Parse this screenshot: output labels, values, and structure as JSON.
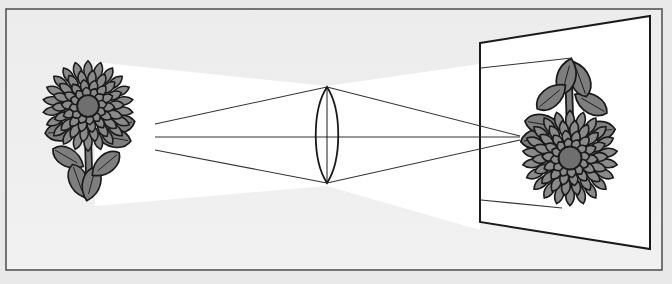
{
  "diagram": {
    "title": "",
    "colors": {
      "background": "#e9e9e9",
      "panel": "#efefef",
      "frame": "#555555",
      "light_cone": "#ffffff",
      "ink": "#1a1a1a",
      "petal": "#8a8a8a",
      "leaf": "#7e7e7e",
      "flower_center": "#6f6f6f",
      "screen": "#ffffff"
    },
    "elements": {
      "object": {
        "label": "",
        "kind": "flower",
        "orientation": "upright"
      },
      "lens": {
        "label": "",
        "kind": "convex-lens"
      },
      "image": {
        "label": "",
        "kind": "flower",
        "orientation": "inverted"
      },
      "screen": {
        "label": "",
        "kind": "projection-screen"
      },
      "rays": {
        "count": 3
      }
    }
  }
}
